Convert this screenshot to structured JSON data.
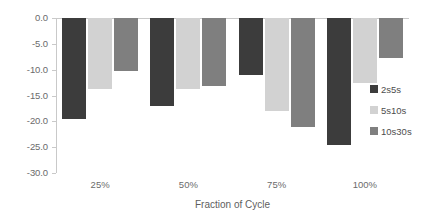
{
  "chart_data": {
    "type": "bar",
    "title": "",
    "subtitle": "",
    "xlabel": "Fraction of Cycle",
    "ylabel": "",
    "categories": [
      "25%",
      "50%",
      "75%",
      "100%"
    ],
    "series": [
      {
        "name": "2s5s",
        "color": "#3c3c3c",
        "values": [
          -19.5,
          -17.0,
          -11.1,
          -24.6
        ]
      },
      {
        "name": "5s10s",
        "color": "#d2d2d2",
        "values": [
          -13.8,
          -13.7,
          -18.0,
          -12.5
        ]
      },
      {
        "name": "10s30s",
        "color": "#7f7f7f",
        "values": [
          -10.3,
          -13.1,
          -21.0,
          -7.8
        ]
      }
    ],
    "ylim": [
      -30.0,
      0.0
    ],
    "y_ticks": [
      0.0,
      -5.0,
      -10.0,
      -15.0,
      -20.0,
      -25.0,
      -30.0
    ],
    "y_tick_labels": [
      "0.0",
      "-5.0",
      "-10.0",
      "-15.0",
      "-20.0",
      "-25.0",
      "-30.0"
    ],
    "grid": false,
    "legend_position": "right",
    "orientation": "vertical",
    "bar_direction": "downward"
  },
  "axis": {
    "y_tick_labels": [
      "0.0",
      "-5.0",
      "-10.0",
      "-15.0",
      "-20.0",
      "-25.0",
      "-30.0"
    ],
    "x_tick_labels": [
      "25%",
      "50%",
      "75%",
      "100%"
    ],
    "x_title": "Fraction of Cycle"
  },
  "legend": {
    "entries": [
      {
        "label": "2s5s"
      },
      {
        "label": "5s10s"
      },
      {
        "label": "10s30s"
      }
    ]
  },
  "colors": {
    "series_0": "#3c3c3c",
    "series_1": "#d2d2d2",
    "series_2": "#7f7f7f",
    "axis": "#c9c9c9",
    "text": "#6b6b6b",
    "background": "#ffffff"
  }
}
